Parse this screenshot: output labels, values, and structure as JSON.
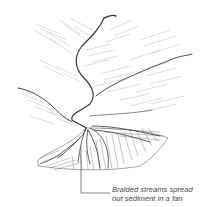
{
  "diagram": {
    "style": "pencil sketch",
    "colors": {
      "background": "#ffffff",
      "stream": "#3a3a3a",
      "hatching": "#9a9a9a",
      "label": "#4a4a4a"
    },
    "label": {
      "line1": "Braided streams spread",
      "line2": "out sediment in a fan"
    }
  }
}
